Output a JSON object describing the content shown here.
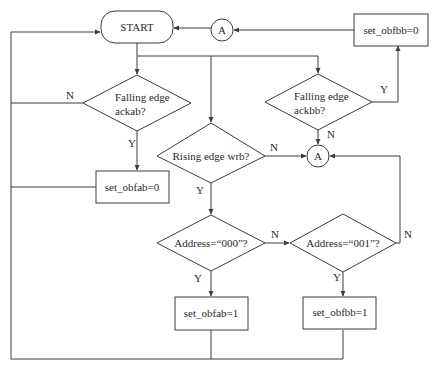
{
  "diagram": {
    "type": "flowchart",
    "nodes": {
      "start": {
        "label": "START",
        "shape": "terminal"
      },
      "connector_top": {
        "label": "A",
        "shape": "circle"
      },
      "set_obfbb0": {
        "label": "set_obfbb=0",
        "shape": "process"
      },
      "dec_ackab": {
        "line1": "Falling edge",
        "line2": "ackab?",
        "shape": "decision"
      },
      "dec_ackbb": {
        "line1": "Falling edge",
        "line2": "ackbb?",
        "shape": "decision"
      },
      "connector_mid": {
        "label": "A",
        "shape": "circle"
      },
      "dec_wrb": {
        "label": "Rising edge wrb?",
        "shape": "decision"
      },
      "set_obfab0": {
        "label": "set_obfab=0",
        "shape": "process"
      },
      "dec_addr000": {
        "label": "Address=“000”?",
        "shape": "decision"
      },
      "dec_addr001": {
        "label": "Address=“001”?",
        "shape": "decision"
      },
      "set_obfab1": {
        "label": "set_obfab=1",
        "shape": "process"
      },
      "set_obfbb1": {
        "label": "set_obfbb=1",
        "shape": "process"
      }
    },
    "edge_labels": {
      "ackab_no": "N",
      "ackab_yes": "Y",
      "ackbb_yes": "Y",
      "ackbb_no": "N",
      "wrb_no": "N",
      "wrb_yes": "Y",
      "addr000_no": "N",
      "addr000_yes": "Y",
      "addr001_no": "N",
      "addr001_yes": "Y"
    },
    "edges": [
      {
        "from": "start",
        "to": "dec_ackab"
      },
      {
        "from": "start",
        "to": "dec_wrb"
      },
      {
        "from": "start",
        "to": "dec_ackbb"
      },
      {
        "from": "dec_ackab",
        "to": "set_obfab0",
        "label": "Y"
      },
      {
        "from": "dec_ackab",
        "to": "start",
        "label": "N"
      },
      {
        "from": "set_obfab0",
        "to": "start"
      },
      {
        "from": "dec_ackbb",
        "to": "set_obfbb0",
        "label": "Y"
      },
      {
        "from": "dec_ackbb",
        "to": "connector_mid",
        "label": "N"
      },
      {
        "from": "set_obfbb0",
        "to": "connector_top"
      },
      {
        "from": "connector_top",
        "to": "start"
      },
      {
        "from": "dec_wrb",
        "to": "connector_mid",
        "label": "N"
      },
      {
        "from": "dec_wrb",
        "to": "dec_addr000",
        "label": "Y"
      },
      {
        "from": "dec_addr000",
        "to": "dec_addr001",
        "label": "N"
      },
      {
        "from": "dec_addr000",
        "to": "set_obfab1",
        "label": "Y"
      },
      {
        "from": "dec_addr001",
        "to": "connector_mid",
        "label": "N"
      },
      {
        "from": "dec_addr001",
        "to": "set_obfbb1",
        "label": "Y"
      },
      {
        "from": "set_obfab1",
        "to": "start"
      },
      {
        "from": "set_obfbb1",
        "to": "start"
      }
    ],
    "colors": {
      "line": "#3c3c3c",
      "text": "#2a2a2a",
      "background": "#ffffff"
    }
  }
}
